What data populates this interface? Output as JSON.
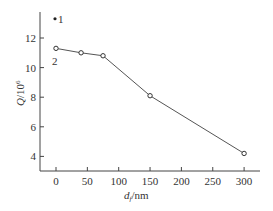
{
  "chart_data": {
    "type": "line",
    "title": "",
    "xlabel": "d_f/nm",
    "ylabel": "Q/10^6",
    "xlim": [
      -15,
      320
    ],
    "ylim": [
      3,
      14
    ],
    "x_ticks": [
      0,
      50,
      100,
      150,
      200,
      250,
      300
    ],
    "y_ticks": [
      4,
      6,
      8,
      10,
      12
    ],
    "grid": false,
    "series": [
      {
        "name": "2",
        "marker": "open-circle",
        "x": [
          0,
          40,
          75,
          150,
          300
        ],
        "y": [
          11.3,
          11.0,
          10.8,
          8.1,
          4.2
        ]
      },
      {
        "name": "1",
        "marker": "filled-dot",
        "x": [
          0
        ],
        "y": [
          13.3
        ]
      }
    ],
    "annotations": [
      {
        "text": "1",
        "near": "filled point at x=0"
      },
      {
        "text": "2",
        "near": "open point at x=0"
      }
    ]
  },
  "labels": {
    "xlabel_main": "d",
    "xlabel_sub": "f",
    "xlabel_unit": "/nm",
    "ylabel_main": "Q",
    "ylabel_unit": "/10",
    "ylabel_exp": "6",
    "series1": "1",
    "series2": "2"
  }
}
